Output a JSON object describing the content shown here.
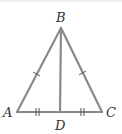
{
  "diagram": {
    "type": "isosceles-triangle-with-median",
    "stroke_color": "#8a8a8a",
    "label_color": "#333333",
    "vertices": {
      "A": {
        "label": "A",
        "x": 17,
        "y": 112
      },
      "B": {
        "label": "B",
        "x": 61,
        "y": 28
      },
      "C": {
        "label": "C",
        "x": 102,
        "y": 112
      },
      "D": {
        "label": "D",
        "x": 60,
        "y": 112
      }
    },
    "segments": [
      "AB",
      "BC",
      "AC",
      "BD"
    ],
    "congruence_marks": [
      {
        "segment": "AB",
        "ticks": 1
      },
      {
        "segment": "BC",
        "ticks": 1
      },
      {
        "segment": "AD",
        "ticks": 2
      },
      {
        "segment": "DC",
        "ticks": 2
      }
    ]
  }
}
